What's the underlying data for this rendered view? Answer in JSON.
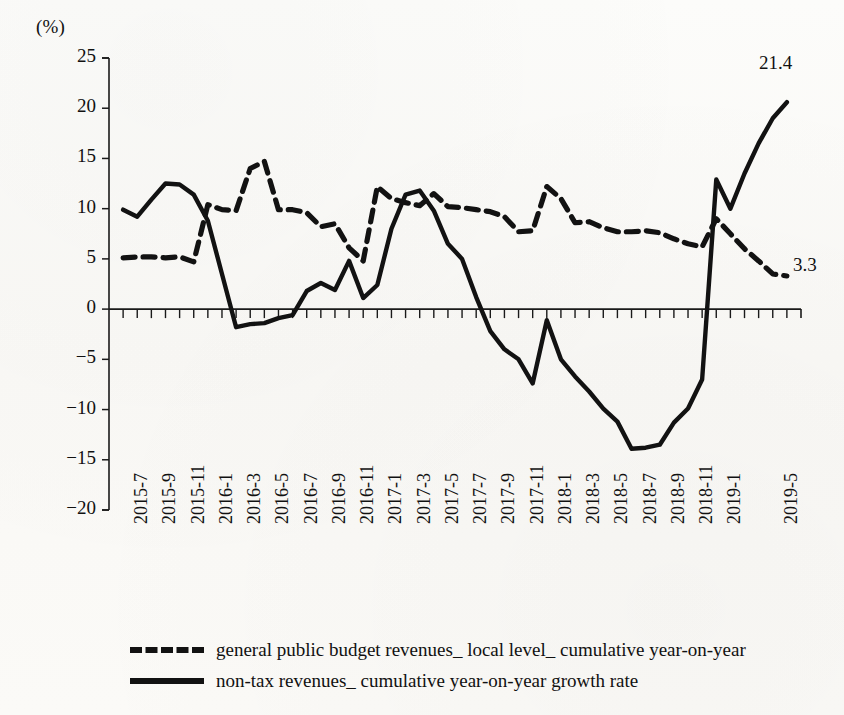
{
  "chart_data": {
    "type": "line",
    "title": "",
    "subtitle": "",
    "xlabel": "",
    "ylabel": "(%)",
    "unit_label": "(%)",
    "ylim": [
      -20,
      25
    ],
    "ytick_step": 5,
    "yticks": [
      25,
      20,
      15,
      10,
      5,
      0,
      -5,
      -10,
      -15,
      -20
    ],
    "ytick_labels": [
      "25",
      "20",
      "15",
      "10",
      "5",
      "0",
      "−5",
      "−10",
      "−15",
      "−20"
    ],
    "grid": false,
    "legend_position": "bottom-left",
    "x": [
      "2015-7",
      "2015-8",
      "2015-9",
      "2015-10",
      "2015-11",
      "2015-12",
      "2016-1",
      "2016-2",
      "2016-3",
      "2016-4",
      "2016-5",
      "2016-6",
      "2016-7",
      "2016-8",
      "2016-9",
      "2016-10",
      "2016-11",
      "2016-12",
      "2017-1",
      "2017-2",
      "2017-3",
      "2017-4",
      "2017-5",
      "2017-6",
      "2017-7",
      "2017-8",
      "2017-9",
      "2017-10",
      "2017-11",
      "2017-12",
      "2018-1",
      "2018-2",
      "2018-3",
      "2018-4",
      "2018-5",
      "2018-6",
      "2018-7",
      "2018-8",
      "2018-9",
      "2018-10",
      "2018-11",
      "2018-12",
      "2019-1",
      "2019-2",
      "2019-3",
      "2019-4",
      "2019-5",
      "2019-6"
    ],
    "xtick_labels": [
      "2015-7",
      "2015-9",
      "2015-11",
      "2016-1",
      "2016-3",
      "2016-5",
      "2016-7",
      "2016-9",
      "2016-11",
      "2017-1",
      "2017-3",
      "2017-5",
      "2017-7",
      "2017-9",
      "2017-11",
      "2018-1",
      "2018-3",
      "2018-5",
      "2018-7",
      "2018-9",
      "2018-11",
      "2019-1",
      "2019-5"
    ],
    "series": [
      {
        "name": "general public budget revenues_ local level_ cumulative year-on-year",
        "style": "dashed",
        "color": "#121212",
        "values": [
          5.1,
          5.2,
          5.2,
          5.1,
          5.2,
          4.7,
          10.4,
          9.9,
          9.8,
          14.0,
          14.7,
          9.9,
          9.9,
          9.6,
          8.2,
          8.5,
          6.1,
          4.8,
          12.2,
          11.0,
          10.6,
          10.3,
          11.5,
          10.2,
          10.1,
          9.9,
          9.7,
          9.2,
          7.7,
          7.8,
          12.2,
          11.0,
          8.6,
          8.7,
          8.1,
          7.7,
          7.7,
          7.8,
          7.6,
          7.0,
          6.5,
          6.2,
          9.0,
          7.5,
          6.0,
          4.8,
          3.5,
          3.3
        ],
        "end_label": "3.3"
      },
      {
        "name": "non-tax revenues_ cumulative year-on-year growth rate",
        "style": "solid",
        "color": "#121212",
        "values": [
          9.9,
          9.2,
          10.9,
          12.5,
          12.4,
          11.4,
          8.8,
          3.5,
          -1.8,
          -1.5,
          -1.4,
          -0.9,
          -0.6,
          1.8,
          2.6,
          1.9,
          4.8,
          1.1,
          2.4,
          8.0,
          11.4,
          11.8,
          9.8,
          6.5,
          5.0,
          1.2,
          -2.2,
          -4.0,
          -5.0,
          -7.4,
          -1.1,
          -5.0,
          -6.7,
          -8.2,
          -9.9,
          -11.2,
          -13.9,
          -13.8,
          -13.5,
          -11.3,
          -9.9,
          -7.0,
          12.9,
          10.0,
          13.5,
          16.5,
          19.0,
          20.6
        ],
        "end_label": "21.4"
      }
    ],
    "annotations": [
      {
        "text": "21.4",
        "series": "non-tax revenues_ cumulative year-on-year growth rate",
        "position": "top-right"
      },
      {
        "text": "3.3",
        "series": "general public budget revenues_ local level_ cumulative year-on-year",
        "position": "right"
      }
    ]
  },
  "legend": {
    "items": [
      {
        "style": "dashed",
        "label": "general public budget revenues_ local level_ cumulative year-on-year"
      },
      {
        "style": "solid",
        "label": "non-tax revenues_ cumulative year-on-year growth rate"
      }
    ]
  },
  "labels": {
    "unit": "(%)",
    "value_21_4": "21.4",
    "value_3_3": "3.3"
  }
}
